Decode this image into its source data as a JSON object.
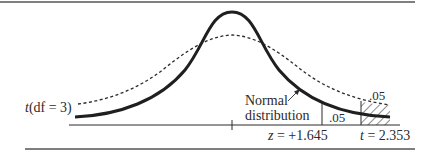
{
  "figure": {
    "type": "distribution-comparison",
    "colors": {
      "ink": "#2b2b2b",
      "rule": "#555555",
      "background": "#ffffff"
    },
    "curves": [
      {
        "name": "Normal distribution",
        "style": "solid-thick"
      },
      {
        "name": "t(df = 3)",
        "style": "dotted"
      }
    ],
    "labels": {
      "t_curve_prefix": "t",
      "t_curve_suffix": "(df = 3)",
      "normal_line1": "Normal",
      "normal_line2": "distribution",
      "normal_tail_area": ".05",
      "t_tail_area": ".05",
      "z_var": "z",
      "z_value": " = +1.645",
      "t_var": "t",
      "t_value": " = 2.353"
    },
    "critical_values": {
      "z": "+1.645",
      "t": "2.353",
      "alpha": ".05"
    }
  }
}
